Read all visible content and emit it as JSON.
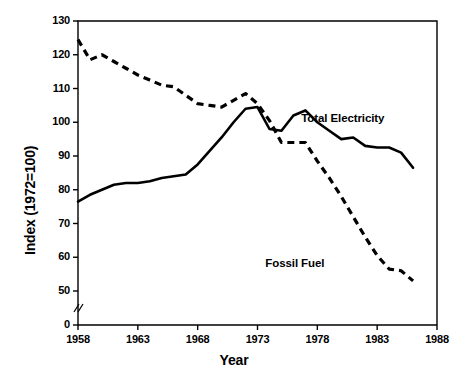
{
  "chart_data": {
    "type": "line",
    "title": "",
    "xlabel": "Year",
    "ylabel": "Index (1972=100)",
    "xlim": [
      1958,
      1988
    ],
    "ylim": [
      50,
      130
    ],
    "y_axis_break": true,
    "y_axis_break_label": "0",
    "grid": false,
    "legend_position": "inline-annotation",
    "xticks": [
      1958,
      1963,
      1968,
      1973,
      1978,
      1983,
      1988
    ],
    "xtick_labels": [
      "1958",
      "1963",
      "1968",
      "1973",
      "1978",
      "1983",
      "1988"
    ],
    "yticks": [
      50,
      60,
      70,
      80,
      90,
      100,
      110,
      120,
      130
    ],
    "ytick_labels": [
      "50",
      "60",
      "70",
      "80",
      "90",
      "100",
      "110",
      "120",
      "130"
    ],
    "x": [
      1958,
      1959,
      1960,
      1961,
      1962,
      1963,
      1964,
      1965,
      1966,
      1967,
      1968,
      1969,
      1970,
      1971,
      1972,
      1973,
      1974,
      1975,
      1976,
      1977,
      1978,
      1979,
      1980,
      1981,
      1982,
      1983,
      1984,
      1985,
      1986
    ],
    "series": [
      {
        "name": "Total Electricity",
        "style": "solid",
        "color": "#000000",
        "values": [
          76.5,
          78.5,
          80.0,
          81.5,
          82.0,
          82.0,
          82.5,
          83.5,
          84.0,
          84.5,
          87.5,
          91.5,
          95.5,
          100.0,
          104.0,
          104.5,
          98.0,
          97.5,
          102.0,
          103.5,
          100.0,
          97.5,
          95.0,
          95.5,
          93.0,
          92.5,
          92.5,
          91.0,
          86.5
        ]
      },
      {
        "name": "Fossil Fuel",
        "style": "dashed",
        "color": "#000000",
        "values": [
          124.5,
          118.5,
          120.0,
          118.0,
          116.0,
          114.0,
          112.5,
          111.0,
          110.5,
          108.0,
          105.5,
          105.0,
          104.5,
          106.5,
          108.5,
          105.5,
          100.5,
          94.0,
          94.0,
          94.0,
          88.5,
          83.5,
          78.0,
          72.0,
          66.0,
          60.5,
          56.5,
          56.0,
          53.0
        ]
      }
    ],
    "annotations": [
      {
        "text": "Total Electricity",
        "x": 1980,
        "y": 101
      },
      {
        "text": "Fossil Fuel",
        "x": 1977,
        "y": 58
      }
    ]
  }
}
